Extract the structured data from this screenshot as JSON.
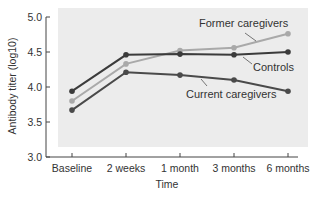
{
  "chart_data": {
    "type": "line",
    "title": "",
    "xlabel": "Time",
    "ylabel": "Antibody titer (log10)",
    "categories": [
      "Baseline",
      "2 weeks",
      "1 month",
      "3 months",
      "6 months"
    ],
    "ylim": [
      3.0,
      5.0
    ],
    "yticks": [
      "3.0",
      "3.5",
      "4.0",
      "4.5",
      "5.0"
    ],
    "grid": false,
    "legend": "inline annotations",
    "series": [
      {
        "name": "Former caregivers",
        "color": "#a9a9a9",
        "values": [
          3.8,
          4.33,
          4.52,
          4.56,
          4.76
        ]
      },
      {
        "name": "Controls",
        "color": "#3b3b3b",
        "values": [
          3.94,
          4.46,
          4.47,
          4.46,
          4.5
        ]
      },
      {
        "name": "Current caregivers",
        "color": "#4a4a4a",
        "values": [
          3.67,
          4.21,
          4.17,
          4.1,
          3.94
        ]
      }
    ],
    "annotations": [
      {
        "text": "Former caregivers",
        "series": "Former caregivers"
      },
      {
        "text": "Controls",
        "series": "Controls"
      },
      {
        "text": "Current caregivers",
        "series": "Current caregivers"
      }
    ]
  },
  "style": {
    "panel_background": "#ececec",
    "axis_color": "#444444"
  }
}
